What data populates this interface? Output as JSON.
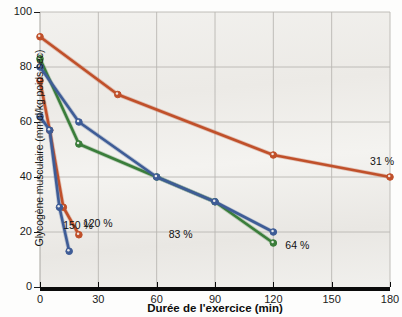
{
  "chart_data": {
    "type": "line",
    "title": "",
    "xlabel": "Durée de l'exercice (min)",
    "ylabel": "Glycogène musculaire (mmol/kg poids sec)",
    "xlim": [
      0,
      180
    ],
    "ylim": [
      0,
      100
    ],
    "xticks": [
      0,
      30,
      60,
      90,
      120,
      150,
      180
    ],
    "yticks": [
      0,
      20,
      40,
      60,
      80,
      100
    ],
    "grid": true,
    "legend_position": "inline-end-of-line",
    "series": [
      {
        "name": "31 %",
        "label": "31 %",
        "color": "#c0502a",
        "points": [
          [
            0,
            91
          ],
          [
            40,
            70
          ],
          [
            120,
            48
          ],
          [
            180,
            40
          ]
        ]
      },
      {
        "name": "64 %",
        "label": "64 %",
        "color": "#3a7d3a",
        "points": [
          [
            0,
            83
          ],
          [
            20,
            52
          ],
          [
            60,
            40
          ],
          [
            90,
            31
          ],
          [
            120,
            16
          ]
        ]
      },
      {
        "name": "83 %",
        "label": "83 %",
        "color": "#3e5c96",
        "points": [
          [
            0,
            80
          ],
          [
            20,
            60
          ],
          [
            60,
            40
          ],
          [
            90,
            31
          ],
          [
            120,
            20
          ]
        ]
      },
      {
        "name": "120 %",
        "label": "120 %",
        "color": "#c0502a",
        "points": [
          [
            0,
            75
          ],
          [
            5,
            57
          ],
          [
            12,
            29
          ],
          [
            20,
            19
          ]
        ]
      },
      {
        "name": "150 %",
        "label": "150 %",
        "color": "#3e5c96",
        "points": [
          [
            0,
            62
          ],
          [
            5,
            57
          ],
          [
            10,
            29
          ],
          [
            15,
            13
          ]
        ]
      }
    ],
    "annotations": [
      {
        "text": "31 %",
        "x": 180,
        "y": 40,
        "dx": 0,
        "dy": -22,
        "align": "right"
      },
      {
        "text": "64 %",
        "x": 120,
        "y": 16,
        "dx": 12,
        "dy": -4,
        "align": "left"
      },
      {
        "text": "83 %",
        "x": 60,
        "y": 20,
        "dx": 12,
        "dy": -4,
        "align": "left"
      },
      {
        "text": "120 %",
        "x": 20,
        "y": 19,
        "dx": 4,
        "dy": -18,
        "align": "left"
      },
      {
        "text": "150 %",
        "x": 15,
        "y": 13,
        "dx": -6,
        "dy": -32,
        "align": "left"
      }
    ]
  },
  "axes": {
    "y_tick_labels": [
      "100",
      "80",
      "60",
      "40",
      "20",
      "0"
    ],
    "x_tick_labels": [
      "0",
      "30",
      "60",
      "90",
      "120",
      "150",
      "180"
    ],
    "y_title": "Glycogène musculaire (mmol/kg poids sec)",
    "x_title": "Durée de l'exercice (min)"
  },
  "colors": {
    "series_orange": "#c0502a",
    "series_green": "#3a7d3a",
    "series_blue": "#3e5c96",
    "grid": "#b9b7b2",
    "axis": "#0a0a0a",
    "plot_bg": "#efedea"
  }
}
